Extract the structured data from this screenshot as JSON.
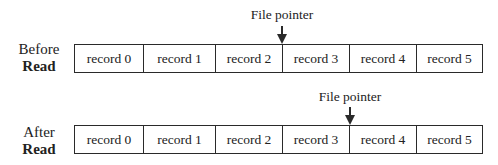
{
  "diagram": {
    "before": {
      "label_line1": "Before",
      "label_line2": "Read",
      "pointer_label": "File pointer",
      "pointer_position_before_record": 3,
      "records": [
        "record 0",
        "record 1",
        "record 2",
        "record 3",
        "record 4",
        "record 5"
      ]
    },
    "after": {
      "label_line1": "After",
      "label_line2": "Read",
      "pointer_label": "File pointer",
      "pointer_position_before_record": 4,
      "records": [
        "record 0",
        "record 1",
        "record 2",
        "record 3",
        "record 4",
        "record 5"
      ]
    },
    "colors": {
      "line": "#2a2a2a",
      "text": "#222222",
      "background": "#ffffff"
    }
  }
}
